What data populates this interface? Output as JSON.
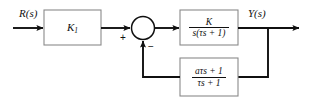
{
  "diagram": {
    "type": "control-system-block-diagram",
    "background_color": "#ffffff",
    "line_color": "#101010",
    "block_fill": "#ffffff",
    "block_border_color": "#8a8a8a"
  },
  "signals": {
    "input_label": "R(s)",
    "output_label": "Y(s)"
  },
  "summing_junction": {
    "name": "summing-junction",
    "shape": "circle",
    "input_sign_forward": "+",
    "input_sign_feedback": "−"
  },
  "blocks": [
    {
      "name": "gain-block",
      "label": "K",
      "subscript": "1"
    },
    {
      "name": "forward-transfer-block",
      "numerator": "K",
      "denominator": "s(τs + 1)"
    },
    {
      "name": "feedback-transfer-block",
      "numerator": "aτs + 1",
      "denominator": "τs + 1"
    }
  ],
  "paths": {
    "input_arrow": "R(s) into gain block",
    "gain_to_sum": "gain block to summing junction",
    "sum_to_forward": "summing junction to forward block",
    "forward_to_output": "forward block to Y(s) output",
    "takeoff_to_feedback": "output takeoff down into feedback block",
    "feedback_to_sum": "feedback block back up to summing junction"
  }
}
